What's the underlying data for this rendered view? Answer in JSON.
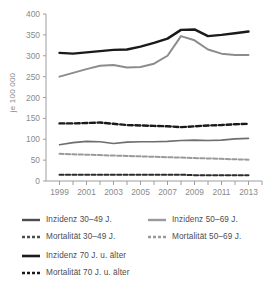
{
  "chart_data": {
    "type": "line",
    "title": "",
    "xlabel": "",
    "ylabel": "je 100 000",
    "xlim": [
      1998,
      2014
    ],
    "ylim": [
      0,
      400
    ],
    "ytick_step": 50,
    "grid": false,
    "legend_position": "bottom",
    "x": [
      1999,
      2000,
      2001,
      2002,
      2003,
      2004,
      2005,
      2006,
      2007,
      2008,
      2009,
      2010,
      2011,
      2012,
      2013
    ],
    "xtick_labels": [
      "1999",
      "2001",
      "2003",
      "2005",
      "2007",
      "2009",
      "2011",
      "2013"
    ],
    "ytick_labels": [
      "0",
      "50",
      "100",
      "150",
      "200",
      "250",
      "300",
      "350",
      "400"
    ],
    "series": [
      {
        "name": "Inzidenz 70 J. u. älter",
        "color": "#1a1a1a",
        "style": "solid",
        "width": 2.4,
        "values": [
          307,
          305,
          308,
          311,
          314,
          315,
          322,
          331,
          341,
          362,
          363,
          347,
          350,
          354,
          358
        ]
      },
      {
        "name": "Inzidenz 50–69 J.",
        "color": "#8c8c8c",
        "style": "solid",
        "width": 2.0,
        "values": [
          250,
          259,
          268,
          276,
          278,
          272,
          273,
          281,
          300,
          347,
          337,
          315,
          305,
          302,
          302
        ]
      },
      {
        "name": "Mortalität 70 J. u. älter",
        "color": "#1a1a1a",
        "style": "dashed",
        "width": 2.4,
        "values": [
          138,
          138,
          139,
          140,
          137,
          134,
          133,
          132,
          131,
          129,
          131,
          133,
          134,
          136,
          137
        ]
      },
      {
        "name": "Inzidenz 30–49 J.",
        "color": "#6e6e6e",
        "style": "solid",
        "width": 1.6,
        "values": [
          87,
          92,
          95,
          94,
          90,
          93,
          94,
          94,
          95,
          97,
          98,
          97,
          98,
          101,
          102
        ]
      },
      {
        "name": "Mortalität 50–69 J.",
        "color": "#9a9a9a",
        "style": "dashed",
        "width": 2.0,
        "values": [
          65,
          64,
          63,
          62,
          61,
          60,
          59,
          58,
          57,
          56,
          55,
          54,
          53,
          52,
          51
        ]
      },
      {
        "name": "Mortalität 30–49 J.",
        "color": "#2b2b2b",
        "style": "dashed",
        "width": 2.0,
        "values": [
          15,
          15,
          15,
          15,
          15,
          15,
          15,
          15,
          15,
          15,
          14,
          14,
          14,
          14,
          14
        ]
      }
    ]
  },
  "legend": {
    "columns": [
      {
        "items": [
          {
            "label": "Inzidenz 30–49 J.",
            "color": "#4d4d4d",
            "style": "solid"
          },
          {
            "label": "Mortalität 30–49 J.",
            "color": "#4d4d4d",
            "style": "dashed"
          }
        ]
      },
      {
        "items": [
          {
            "label": "Inzidenz 50–69 J.",
            "color": "#9a9a9a",
            "style": "solid"
          },
          {
            "label": "Mortalität 50–69 J.",
            "color": "#9a9a9a",
            "style": "dashed"
          }
        ]
      },
      {
        "items": [
          {
            "label": "Inzidenz 70 J. u. älter",
            "color": "#1a1a1a",
            "style": "solid"
          },
          {
            "label": "Mortalität 70 J. u. älter",
            "color": "#1a1a1a",
            "style": "dashed"
          }
        ]
      }
    ]
  },
  "axis": {
    "unit_label": "je 100 000",
    "tick_color": "#8a8a8a",
    "axis_color": "#9e9e9e"
  }
}
